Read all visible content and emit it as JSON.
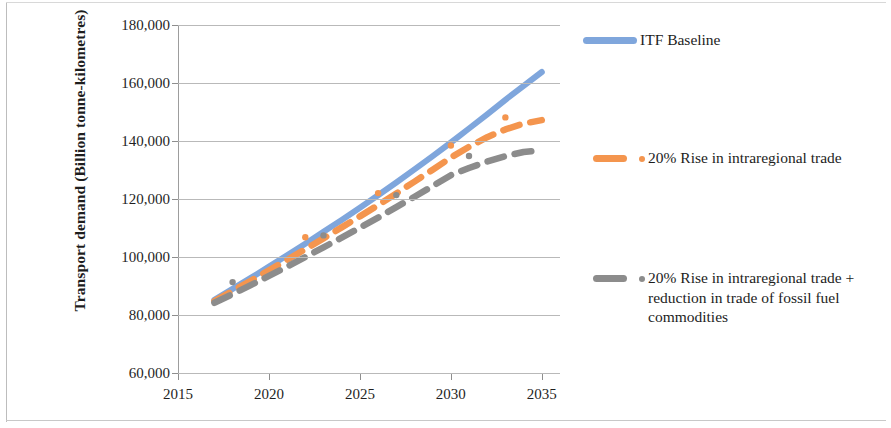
{
  "axes": {
    "y_title": "Transport demand (Billion tonne-kilometres)",
    "y_ticks": [
      "180,000",
      "160,000",
      "140,000",
      "120,000",
      "100,000",
      "80,000",
      "60,000"
    ],
    "x_ticks": [
      "2015",
      "2020",
      "2025",
      "2030",
      "2035"
    ]
  },
  "legend": {
    "items": [
      {
        "label": "ITF Baseline",
        "color": "#7FA6DC",
        "style": "solid",
        "marker": false
      },
      {
        "label": "20% Rise in intraregional trade",
        "color": "#F4954E",
        "style": "dashed",
        "marker": true
      },
      {
        "label": "20% Rise in intraregional trade +  reduction in trade of fossil fuel commodities",
        "color": "#8C8C8C",
        "style": "dashed",
        "marker": true
      }
    ]
  },
  "colors": {
    "baseline_blue": "#7FA6DC",
    "rise_orange": "#F4954E",
    "rise_fossil_gray": "#8C8C8C",
    "gridline": "#b9b9b9",
    "axis": "#9d9d9d",
    "text": "#1f1f1f"
  },
  "chart_data": {
    "type": "line",
    "title": "",
    "xlabel": "",
    "ylabel": "Transport demand (Billion tonne-kilometres)",
    "xlim": [
      2015,
      2036
    ],
    "ylim": [
      60000,
      180000
    ],
    "ytick_step": 20000,
    "grid": true,
    "legend_position": "right",
    "x": [
      2017,
      2018,
      2019,
      2020,
      2021,
      2022,
      2023,
      2024,
      2025,
      2026,
      2027,
      2028,
      2029,
      2030,
      2031,
      2032,
      2033,
      2034,
      2035
    ],
    "series": [
      {
        "name": "ITF Baseline",
        "color": "#7FA6DC",
        "style": "solid",
        "values": [
          85200,
          89000,
          92800,
          96700,
          100600,
          104600,
          108700,
          112800,
          117000,
          121300,
          125700,
          130200,
          134800,
          139500,
          144300,
          149200,
          154200,
          159000,
          163800
        ]
      },
      {
        "name": "20% Rise in intraregional trade",
        "color": "#F4954E",
        "style": "dashed",
        "values": [
          84800,
          88300,
          91800,
          95400,
          99000,
          102700,
          106400,
          110200,
          114000,
          117900,
          121900,
          126000,
          130100,
          134300,
          138000,
          141300,
          144000,
          146000,
          147200
        ]
      },
      {
        "name": "20% Rise in intraregional trade +  reduction in trade of fossil fuel commodities",
        "color": "#8C8C8C",
        "style": "dashed",
        "values": [
          84200,
          87200,
          90300,
          93500,
          96700,
          100000,
          103300,
          106700,
          110100,
          113600,
          117200,
          120800,
          124500,
          128200,
          130700,
          132900,
          134800,
          136200,
          136900
        ]
      }
    ]
  }
}
